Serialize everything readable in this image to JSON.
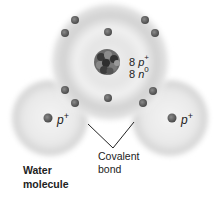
{
  "diagram": {
    "title": "Water molecule",
    "title_lines": [
      "Water",
      "molecule"
    ],
    "oxygen": {
      "protons_count": "8",
      "protons_symbol": "p",
      "protons_charge": "+",
      "neutrons_count": "8",
      "neutrons_symbol": "n",
      "neutrons_charge": "0"
    },
    "hydrogen_left": {
      "symbol": "p",
      "charge": "+"
    },
    "hydrogen_right": {
      "symbol": "p",
      "charge": "+"
    },
    "bond_label_lines": [
      "Covalent",
      "bond"
    ],
    "colors": {
      "cloud": "#d4d4d4",
      "electron": "#5c5c5c",
      "nucleus_dark": "#333333",
      "nucleus_light": "#8a8a8a",
      "text": "#222222"
    },
    "electrons": [
      {
        "x": 75,
        "y": 20
      },
      {
        "x": 65,
        "y": 33
      },
      {
        "x": 108,
        "y": 32
      },
      {
        "x": 145,
        "y": 20
      },
      {
        "x": 155,
        "y": 33
      },
      {
        "x": 65,
        "y": 90
      },
      {
        "x": 75,
        "y": 103
      },
      {
        "x": 108,
        "y": 98
      },
      {
        "x": 153,
        "y": 91
      },
      {
        "x": 143,
        "y": 103
      },
      {
        "x": 48,
        "y": 118
      },
      {
        "x": 172,
        "y": 118
      }
    ]
  }
}
